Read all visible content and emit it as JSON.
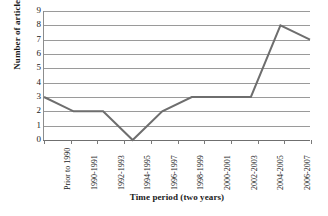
{
  "chart_data": {
    "type": "line",
    "title": "",
    "xlabel": "Time period (two years)",
    "ylabel": "Number of articles",
    "categories": [
      "Prior to 1990",
      "1990-1991",
      "1992-1993",
      "1994-1995",
      "1996-1997",
      "1998-1999",
      "2000-2001",
      "2002-2003",
      "2004-2005",
      "2006-2007"
    ],
    "values": [
      3,
      2,
      2,
      0,
      2,
      3,
      3,
      3,
      8,
      7
    ],
    "ylim": [
      0,
      9
    ],
    "ytick_labels": [
      "0",
      "1",
      "2",
      "3",
      "4",
      "5",
      "6",
      "7",
      "8",
      "9"
    ],
    "ytick_values": [
      0,
      1,
      2,
      3,
      4,
      5,
      6,
      7,
      8,
      9
    ],
    "grid": true,
    "grid_axis": "y",
    "legend": false,
    "legend_position": "none",
    "series_color": "#6e6e6e",
    "gridline_color": "#9a9a9a",
    "axis_color": "#7a7a7a",
    "background_color": "#ffffff",
    "text_color": "#1a1a1a",
    "series_line_width": 2,
    "xlabel_rotation": 90
  }
}
